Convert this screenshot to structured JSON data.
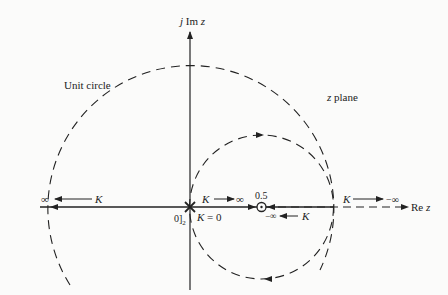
{
  "diagram": {
    "colors": {
      "ink": "#222222",
      "background": "#fbfbfa"
    },
    "axes": {
      "imag_label": "j Im z",
      "real_label": "Re z"
    },
    "labels": {
      "unit_circle": "Unit circle",
      "plane": "z plane",
      "zero_value": "0.5",
      "origin_pole": "0]₂",
      "k_zero": "K = 0",
      "k_to_inf": "K → ∞",
      "k_left_inf": "∞ ← K",
      "k_neg_inf_right": "K → −∞",
      "k_neg_inf_left": "−∞ ← K"
    },
    "elements": {
      "double_pole": {
        "z": 0,
        "multiplicity": 2,
        "symbol": "cross"
      },
      "zero": {
        "z": 0.5,
        "symbol": "circled-dot"
      },
      "unit_circle": {
        "center": 0,
        "radius": 1
      },
      "locus_circle": {
        "center": 0.5,
        "radius": 0.5
      }
    }
  }
}
